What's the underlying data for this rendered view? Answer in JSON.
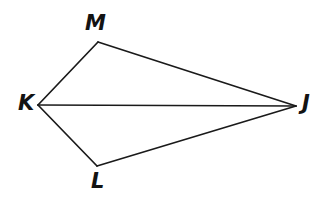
{
  "figure": {
    "kind": "geometry-diagram",
    "canvas": {
      "width": 329,
      "height": 201,
      "background": "#ffffff"
    },
    "stroke": {
      "color": "#1a1a1a",
      "width": 1.7
    },
    "vertices": [
      {
        "id": "M",
        "label": "M",
        "x": 98,
        "y": 42,
        "label_x": 85,
        "label_y": 13
      },
      {
        "id": "K",
        "label": "K",
        "x": 38,
        "y": 105,
        "label_x": 18,
        "label_y": 93
      },
      {
        "id": "J",
        "label": "J",
        "x": 296,
        "y": 106,
        "label_x": 302,
        "label_y": 93
      },
      {
        "id": "L",
        "label": "L",
        "x": 97,
        "y": 166,
        "label_x": 91,
        "label_y": 171
      }
    ],
    "segments": [
      {
        "id": "KM",
        "from": "K",
        "to": "M"
      },
      {
        "id": "MJ",
        "from": "M",
        "to": "J"
      },
      {
        "id": "KJ",
        "from": "K",
        "to": "J"
      },
      {
        "id": "KL",
        "from": "K",
        "to": "L"
      },
      {
        "id": "LJ",
        "from": "L",
        "to": "J"
      }
    ]
  }
}
